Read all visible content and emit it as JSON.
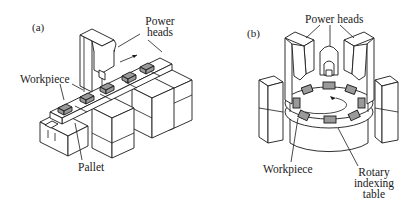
{
  "figure": {
    "panels": [
      {
        "tag": "(a)",
        "labels": {
          "power_heads_line1": "Power",
          "power_heads_line2": "heads",
          "workpiece": "Workpiece",
          "pallet": "Pallet"
        }
      },
      {
        "tag": "(b)",
        "labels": {
          "power_heads": "Power heads",
          "workpiece": "Workpiece",
          "rotary_line1": "Rotary",
          "rotary_line2": "indexing",
          "rotary_line3": "table"
        }
      }
    ],
    "colors": {
      "line": "#1a1a1a",
      "workpiece_fill": "#9a9a9a",
      "background": "#ffffff"
    }
  }
}
